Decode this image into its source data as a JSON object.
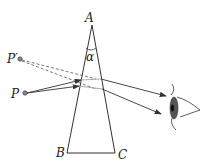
{
  "diagram": {
    "labels": {
      "apex": "A",
      "base_left": "B",
      "base_right": "C",
      "apex_angle": "α",
      "object": "P",
      "image": "P′"
    },
    "icons": {
      "eye": "eye-icon"
    },
    "colors": {
      "line": "#333333",
      "dashed": "#555555",
      "inside_ray": "#aaaaaa",
      "eye_fill": "#555555"
    }
  }
}
